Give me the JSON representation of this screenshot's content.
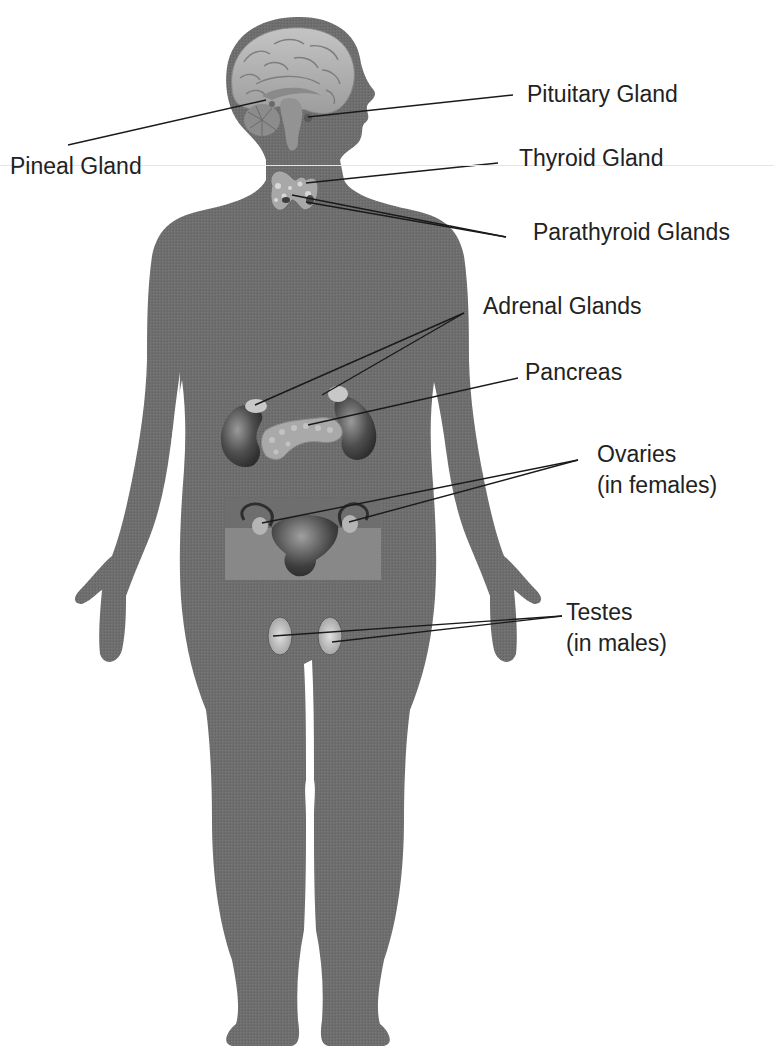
{
  "colors": {
    "silhouette": "#6e6e6e",
    "leader_line": "#1a1a1a",
    "label_text": "#222222",
    "organ_light": "#bdbdbd",
    "organ_dark": "#4a4a4a",
    "background": "#ffffff"
  },
  "labels": [
    {
      "id": "pituitary",
      "lines": [
        "Pituitary Gland"
      ]
    },
    {
      "id": "pineal",
      "lines": [
        "Pineal Gland"
      ]
    },
    {
      "id": "thyroid",
      "lines": [
        "Thyroid Gland"
      ]
    },
    {
      "id": "parathyroid",
      "lines": [
        "Parathyroid Glands"
      ]
    },
    {
      "id": "adrenal",
      "lines": [
        "Adrenal Glands"
      ]
    },
    {
      "id": "pancreas",
      "lines": [
        "Pancreas"
      ]
    },
    {
      "id": "ovaries",
      "lines": [
        "Ovaries",
        "(in females)"
      ]
    },
    {
      "id": "testes",
      "lines": [
        "Testes",
        "(in males)"
      ]
    }
  ],
  "organs": [
    {
      "id": "brain",
      "name": "Brain (sagittal section)"
    },
    {
      "id": "pituitary-gland",
      "name": "Pituitary Gland"
    },
    {
      "id": "pineal-gland",
      "name": "Pineal Gland"
    },
    {
      "id": "thyroid-gland",
      "name": "Thyroid Gland"
    },
    {
      "id": "parathyroid-glands",
      "name": "Parathyroid Glands"
    },
    {
      "id": "kidneys-adrenals",
      "name": "Kidneys with Adrenal Glands"
    },
    {
      "id": "pancreas",
      "name": "Pancreas"
    },
    {
      "id": "uterus-ovaries",
      "name": "Uterus and Ovaries"
    },
    {
      "id": "testes",
      "name": "Testes"
    }
  ]
}
